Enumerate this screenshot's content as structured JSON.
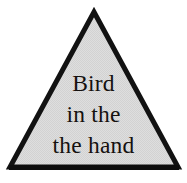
{
  "figure": {
    "shape": "triangle",
    "background_color": "#ffffff",
    "fill_color": "#dcdcdc",
    "outline_color": "#121212",
    "text_color": "#15110f",
    "outline_width_px": 5,
    "vertices": {
      "apex": "94,12",
      "bottom_left": "10,167",
      "bottom_right": "178,167"
    }
  },
  "caption": {
    "full_text": "Bird in the the hand",
    "lines": [
      "Bird",
      "in the",
      "the hand"
    ],
    "line_1": "Bird",
    "line_2": "in the",
    "line_3": "the hand"
  }
}
